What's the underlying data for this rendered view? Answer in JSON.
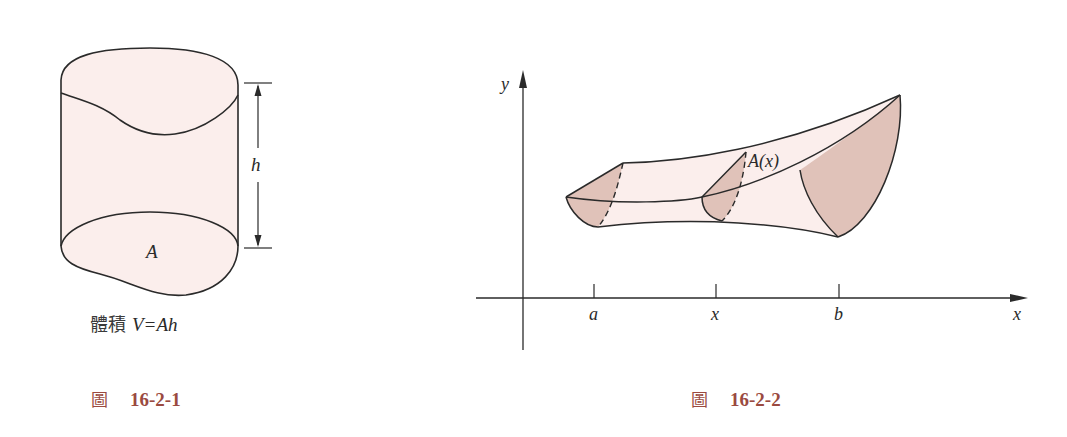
{
  "figure_1": {
    "caption_prefix": "圖",
    "caption_number": "16-2-1",
    "label_area": "A",
    "label_height": "h",
    "formula_prefix": "體積",
    "formula": "V=Ah",
    "colors": {
      "surface": "#fbeeec",
      "stroke": "#2a2a2a"
    }
  },
  "figure_2": {
    "caption_prefix": "圖",
    "caption_number": "16-2-2",
    "y_axis_label": "y",
    "x_axis_label": "x",
    "cross_section_label": "A(x)",
    "ticks": [
      {
        "label": "a"
      },
      {
        "label": "x"
      },
      {
        "label": "b"
      }
    ],
    "colors": {
      "surface": "#fbeeec",
      "cross_section": "#e0c2b9",
      "stroke": "#2a2a2a"
    }
  },
  "colors": {
    "caption": "#9a4a40",
    "background": "#ffffff"
  }
}
